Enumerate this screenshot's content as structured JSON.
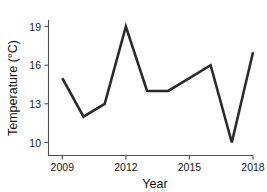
{
  "chart_data": {
    "type": "line",
    "title": "",
    "xlabel": "Year",
    "ylabel": "Temperature (°C)",
    "x": [
      2009,
      2010,
      2011,
      2012,
      2013,
      2014,
      2015,
      2016,
      2017,
      2018
    ],
    "values": [
      15.0,
      12.0,
      13.0,
      19.0,
      14.0,
      14.0,
      15.0,
      16.0,
      10.0,
      17.0
    ],
    "series": [
      {
        "name": "Temperature",
        "values": [
          15.0,
          12.0,
          13.0,
          19.0,
          14.0,
          14.0,
          15.0,
          16.0,
          10.0,
          17.0
        ]
      }
    ],
    "xlim": [
      2009,
      2018
    ],
    "ylim": [
      9.3,
      19.6
    ],
    "xticks": [
      2009,
      2012,
      2015,
      2018
    ],
    "yticks": [
      10,
      13,
      16,
      19
    ],
    "xtick_labels": [
      "2009",
      "2012",
      "2015",
      "2018"
    ],
    "ytick_labels": [
      "10",
      "13",
      "16",
      "19"
    ],
    "grid": false,
    "legend": false,
    "line_color": "#2b2b2b",
    "axis_color": "#4d4d4d",
    "background": "#ffffff"
  },
  "axes": {
    "x_title": "Year",
    "y_title": "Temperature (°C)"
  },
  "ticks": {
    "x": [
      {
        "label": "2009"
      },
      {
        "label": "2012"
      },
      {
        "label": "2015"
      },
      {
        "label": "2018"
      }
    ],
    "y": [
      {
        "label": "19"
      },
      {
        "label": "16"
      },
      {
        "label": "13"
      },
      {
        "label": "10"
      }
    ]
  }
}
